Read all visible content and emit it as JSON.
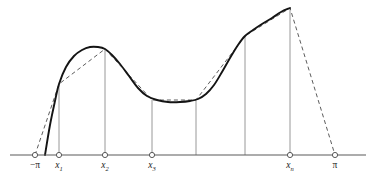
{
  "figure": {
    "background_color": "#ffffff",
    "curve_color": "#141414",
    "chord_color": "#4a4a4a",
    "axis_color": "#5a5a5a",
    "ordinate_color": "#8c8c8c",
    "marker_fill": "#ffffff"
  },
  "axis": {
    "name": "x-axis",
    "y_pixel": 155,
    "x_start": 10,
    "x_end": 366
  },
  "ticks": [
    {
      "label": "−π",
      "sub": "",
      "x": 35,
      "italic": false,
      "has_marker": true
    },
    {
      "label": "x",
      "sub": "1",
      "x": 59,
      "italic": true,
      "has_marker": true
    },
    {
      "label": "x",
      "sub": "2",
      "x": 105,
      "italic": true,
      "has_marker": true
    },
    {
      "label": "x",
      "sub": "3",
      "x": 152,
      "italic": true,
      "has_marker": true
    },
    {
      "label": "",
      "sub": "",
      "x": 196,
      "italic": false,
      "has_marker": false
    },
    {
      "label": "",
      "sub": "",
      "x": 245,
      "italic": false,
      "has_marker": false
    },
    {
      "label": "x",
      "sub": "n",
      "x": 290,
      "italic": true,
      "has_marker": true
    },
    {
      "label": "π",
      "sub": "",
      "x": 335,
      "italic": false,
      "has_marker": true
    }
  ],
  "chart_data": {
    "type": "line",
    "title": "",
    "xlabel": "",
    "ylabel": "",
    "grid": false,
    "legend_position": "none",
    "x_tick_labels": [
      "−π",
      "x₁",
      "x₂",
      "x₃",
      "",
      "",
      "xₙ",
      "π"
    ],
    "x_tick_pixels": [
      35,
      59,
      105,
      152,
      196,
      245,
      290,
      335
    ],
    "baseline_y_pixel": 155,
    "series": [
      {
        "name": "smooth function",
        "style": "solid",
        "color": "#141414",
        "points_pixel": [
          [
            45,
            155
          ],
          [
            50,
            125
          ],
          [
            55,
            101
          ],
          [
            59,
            84
          ],
          [
            66,
            67
          ],
          [
            74,
            56
          ],
          [
            82,
            50
          ],
          [
            90,
            47
          ],
          [
            98,
            47
          ],
          [
            105,
            49
          ],
          [
            112,
            55
          ],
          [
            120,
            64
          ],
          [
            129,
            76
          ],
          [
            138,
            88
          ],
          [
            147,
            96
          ],
          [
            157,
            100
          ],
          [
            168,
            102
          ],
          [
            180,
            102
          ],
          [
            190,
            101
          ],
          [
            198,
            99
          ],
          [
            206,
            94
          ],
          [
            214,
            85
          ],
          [
            222,
            72
          ],
          [
            230,
            58
          ],
          [
            238,
            45
          ],
          [
            245,
            36
          ],
          [
            253,
            30
          ],
          [
            262,
            24
          ],
          [
            272,
            18
          ],
          [
            281,
            12
          ],
          [
            290,
            8
          ]
        ]
      },
      {
        "name": "piecewise linear interpolant",
        "style": "dashed",
        "color": "#4a4a4a",
        "nodes_pixel": [
          [
            35,
            155
          ],
          [
            59,
            84
          ],
          [
            105,
            49
          ],
          [
            152,
            100
          ],
          [
            196,
            100
          ],
          [
            245,
            36
          ],
          [
            290,
            8
          ],
          [
            335,
            155
          ]
        ]
      }
    ],
    "ordinate_segments": [
      {
        "x": 59,
        "y_top": 84,
        "y_bottom": 155
      },
      {
        "x": 105,
        "y_top": 49,
        "y_bottom": 155
      },
      {
        "x": 152,
        "y_top": 100,
        "y_bottom": 155
      },
      {
        "x": 196,
        "y_top": 100,
        "y_bottom": 155
      },
      {
        "x": 245,
        "y_top": 36,
        "y_bottom": 155
      },
      {
        "x": 290,
        "y_top": 8,
        "y_bottom": 155
      }
    ]
  }
}
